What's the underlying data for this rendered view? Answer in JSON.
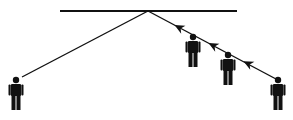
{
  "diagram": {
    "colors": {
      "ink": "#111111",
      "background": "#ffffff"
    },
    "mirror_line": {
      "x1": 60,
      "y1": 11,
      "x2": 237,
      "y2": 11
    },
    "reflection_point": {
      "x": 148,
      "y": 11
    },
    "rays": [
      {
        "name": "left-ray",
        "from": [
          148,
          11
        ],
        "to": [
          22,
          77
        ]
      },
      {
        "name": "right-ray",
        "from": [
          148,
          11
        ],
        "to": [
          276,
          79
        ]
      }
    ],
    "arrows": [
      {
        "x": 178,
        "y": 27
      },
      {
        "x": 212,
        "y": 45
      },
      {
        "x": 247,
        "y": 63
      }
    ],
    "people": [
      {
        "name": "person-left",
        "x": 16,
        "y": 77,
        "scale": 1.0
      },
      {
        "name": "person-right-1",
        "x": 193,
        "y": 34,
        "scale": 1.0
      },
      {
        "name": "person-right-2",
        "x": 228,
        "y": 52,
        "scale": 1.0
      },
      {
        "name": "person-right-3",
        "x": 278,
        "y": 77,
        "scale": 1.0
      }
    ]
  }
}
